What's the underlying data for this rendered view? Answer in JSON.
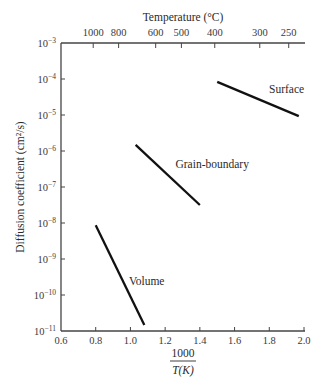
{
  "chart_data": {
    "type": "line",
    "title": "",
    "top_axis": {
      "label": "Temperature (°C)",
      "ticks": [
        1000,
        800,
        600,
        500,
        400,
        300,
        250
      ]
    },
    "xlabel_numerator": "1000",
    "xlabel_denominator": "T(K)",
    "xlabel": "1000 / T(K)",
    "ylabel": "Diffusion coefficient (cm²/s)",
    "xlim": [
      0.6,
      2.0
    ],
    "x_ticks": [
      "0.6",
      "0.8",
      "1.0",
      "1.2",
      "1.4",
      "1.6",
      "1.8",
      "2.0"
    ],
    "yscale": "log",
    "ylim": [
      1e-11,
      0.001
    ],
    "y_tick_exponents": [
      -3,
      -4,
      -5,
      -6,
      -7,
      -8,
      -9,
      -10,
      -11
    ],
    "grid": false,
    "legend": "inline labels",
    "series": [
      {
        "name": "Surface",
        "x": [
          1.5,
          1.97
        ],
        "y": [
          8.3e-05,
          9.3e-06
        ],
        "log10_y": [
          -4.08,
          -5.03
        ]
      },
      {
        "name": "Grain-boundary",
        "x": [
          1.03,
          1.4
        ],
        "y": [
          1.5e-06,
          3.2e-08
        ],
        "log10_y": [
          -5.83,
          -7.5
        ]
      },
      {
        "name": "Volume",
        "x": [
          0.8,
          1.08
        ],
        "y": [
          8.7e-09,
          1.5e-11
        ],
        "log10_y": [
          -8.06,
          -10.83
        ]
      }
    ],
    "colors": {
      "line": "#111111",
      "axis": "#444444",
      "text": "#2a2a2a"
    }
  }
}
